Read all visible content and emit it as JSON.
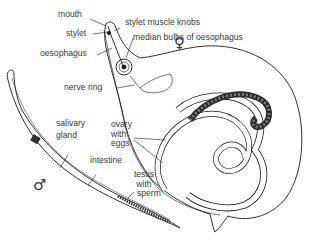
{
  "diagram": {
    "labels": {
      "mouth": "mouth",
      "stylet": "stylet",
      "oesophagus": "oesophagus",
      "stylet_muscle_knobs": "stylet muscle knobs",
      "median_bulbs": "median bulbs of oesophagus",
      "nerve_ring": "nerve ring",
      "salivary_gland_1": "salivary",
      "salivary_gland_2": "gland",
      "ovary_1": "ovary",
      "ovary_2": "with",
      "ovary_3": "eggs",
      "intestine": "intestine",
      "testis_1": "testis",
      "testis_2": "with",
      "testis_3": "sperm"
    },
    "symbols": {
      "female": "♀",
      "male": "♂"
    },
    "colors": {
      "line": "#1a1a1a",
      "text": "#3a3a3a",
      "background": "#ffffff"
    }
  }
}
